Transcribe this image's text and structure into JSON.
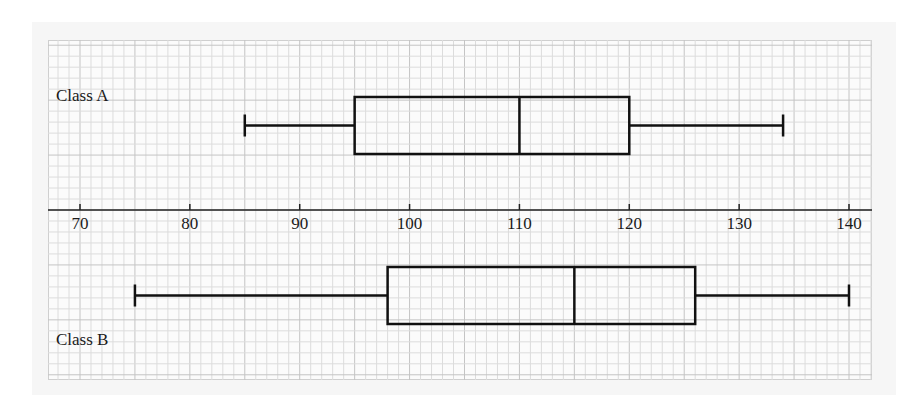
{
  "chart_data": {
    "type": "boxplot",
    "title": "",
    "xlabel": "",
    "ylabel": "",
    "xlim": [
      67,
      142
    ],
    "x_ticks": [
      70,
      80,
      90,
      100,
      110,
      120,
      130,
      140
    ],
    "grid": true,
    "grid_minor_step": 1,
    "grid_major_step": 5,
    "series": [
      {
        "name": "Class A",
        "min": 85,
        "q1": 95,
        "median": 110,
        "q3": 120,
        "max": 134,
        "position": "above axis"
      },
      {
        "name": "Class B",
        "min": 75,
        "q1": 98,
        "median": 115,
        "q3": 126,
        "max": 140,
        "position": "below axis"
      }
    ]
  },
  "labels": {
    "class_a": "Class A",
    "class_b": "Class B"
  },
  "ticks": [
    "70",
    "80",
    "90",
    "100",
    "110",
    "120",
    "130",
    "140"
  ],
  "colors": {
    "grid_minor": "#dcdcdc",
    "grid_major": "#c4c4c4",
    "ink": "#111111"
  }
}
